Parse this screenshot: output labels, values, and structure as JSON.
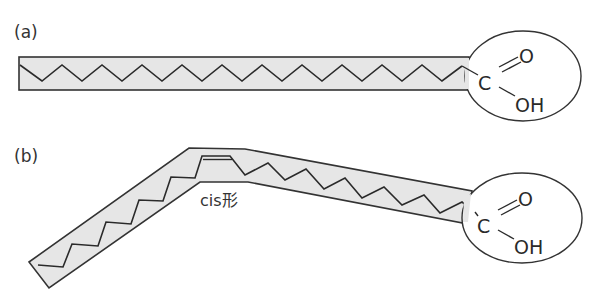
{
  "figure": {
    "panels": [
      {
        "label": "(a)",
        "description": "Saturated fatty acid: straight hydrocarbon chain with carboxyl head group",
        "head_group": {
          "carbon": "C",
          "oxygen_double": "O",
          "hydroxyl": "OH"
        }
      },
      {
        "label": "(b)",
        "description": "Unsaturated fatty acid: chain bent at a cis double bond, with carboxyl head group",
        "annotation": "cis形",
        "head_group": {
          "carbon": "C",
          "oxygen_double": "O",
          "hydroxyl": "OH"
        }
      }
    ],
    "colors": {
      "band_fill": "#e6e6e6",
      "line": "#2a2a2a",
      "background": "#ffffff"
    }
  }
}
